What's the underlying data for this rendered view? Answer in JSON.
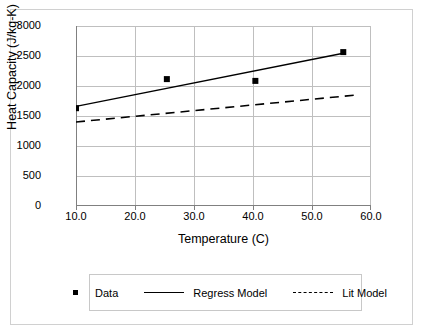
{
  "chart_data": {
    "type": "scatter",
    "title": "",
    "xlabel": "Temperature (C)",
    "ylabel": "Heat Capacity (J/kg-K)",
    "xlim": [
      10.0,
      60.0
    ],
    "ylim": [
      0,
      3000
    ],
    "xticks": [
      "10.0",
      "20.0",
      "30.0",
      "40.0",
      "50.0",
      "60.0"
    ],
    "xtick_values": [
      10,
      20,
      30,
      40,
      50,
      60
    ],
    "yticks": [
      "0",
      "500",
      "1000",
      "1500",
      "2000",
      "2500",
      "3000"
    ],
    "ytick_values": [
      0,
      500,
      1000,
      1500,
      2000,
      2500,
      3000
    ],
    "grid": "horizontal-and-vertical",
    "legend_position": "below-plot",
    "series": [
      {
        "name": "Data",
        "style": "marker",
        "marker": "square",
        "color": "#000000",
        "points": [
          {
            "x": 10.0,
            "y": 1630
          },
          {
            "x": 25.4,
            "y": 2115
          },
          {
            "x": 40.4,
            "y": 2085
          },
          {
            "x": 55.3,
            "y": 2565
          }
        ]
      },
      {
        "name": "Regress Model",
        "style": "solid-line",
        "color": "#000000",
        "points": [
          {
            "x": 10.0,
            "y": 1660
          },
          {
            "x": 55.3,
            "y": 2545
          }
        ]
      },
      {
        "name": "Lit Model",
        "style": "dashed-line",
        "color": "#000000",
        "points": [
          {
            "x": 10.0,
            "y": 1400
          },
          {
            "x": 57.5,
            "y": 1850
          }
        ]
      }
    ]
  },
  "legend": {
    "items": [
      {
        "label": "Data",
        "swatch": "square-marker"
      },
      {
        "label": "Regress Model",
        "swatch": "solid-line"
      },
      {
        "label": "Lit Model",
        "swatch": "dashed-line"
      }
    ]
  },
  "axes": {
    "y_title": "Heat Capacity (J/kg-K)",
    "x_title": "Temperature (C)"
  },
  "colors": {
    "ink": "#000000",
    "grid": "#bfbfbf",
    "axis": "#808080",
    "frame": "#d0d0d0",
    "background": "#ffffff"
  }
}
